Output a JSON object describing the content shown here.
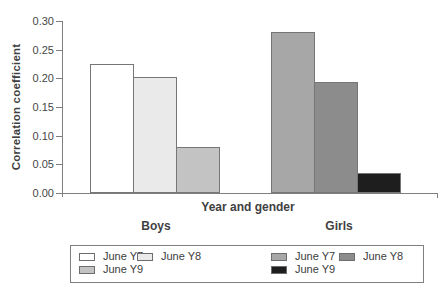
{
  "chart_data": {
    "type": "bar",
    "title": "",
    "xlabel": "Year and gender",
    "ylabel": "Correlation coefficient",
    "ylim": [
      0,
      0.3
    ],
    "ytick_step": 0.05,
    "yticks": [
      "0.30",
      "0.25",
      "0.20",
      "0.15",
      "0.10",
      "0.05",
      "0.00"
    ],
    "grid": false,
    "legend_position": "bottom",
    "categories": [
      "Boys",
      "Girls"
    ],
    "groups": [
      {
        "label": "Boys",
        "bars": [
          {
            "name": "June Y7",
            "value": 0.225,
            "color": "#ffffff"
          },
          {
            "name": "June Y8",
            "value": 0.203,
            "color": "#eaeaea"
          },
          {
            "name": "June Y9",
            "value": 0.08,
            "color": "#c3c3c3"
          }
        ]
      },
      {
        "label": "Girls",
        "bars": [
          {
            "name": "June Y7",
            "value": 0.28,
            "color": "#a7a7a7"
          },
          {
            "name": "June Y8",
            "value": 0.193,
            "color": "#8c8c8c"
          },
          {
            "name": "June Y9",
            "value": 0.035,
            "color": "#1e1e1e"
          }
        ]
      }
    ],
    "legend": {
      "entries": [
        {
          "label": "June Y7",
          "color": "#ffffff",
          "row": 0,
          "col": 0
        },
        {
          "label": "June Y8",
          "color": "#eaeaea",
          "row": 0,
          "col": 1
        },
        {
          "label": "June Y7",
          "color": "#a7a7a7",
          "row": 0,
          "col": 2
        },
        {
          "label": "June Y8",
          "color": "#8c8c8c",
          "row": 0,
          "col": 3
        },
        {
          "label": "June Y9",
          "color": "#c3c3c3",
          "row": 1,
          "col": 0
        },
        {
          "label": "June Y9",
          "color": "#1e1e1e",
          "row": 1,
          "col": 2
        }
      ]
    },
    "colors": {
      "axis": "#7f7f7f",
      "text": "#3c3c3c",
      "bar_border": "#767676",
      "background": "#ffffff"
    }
  }
}
